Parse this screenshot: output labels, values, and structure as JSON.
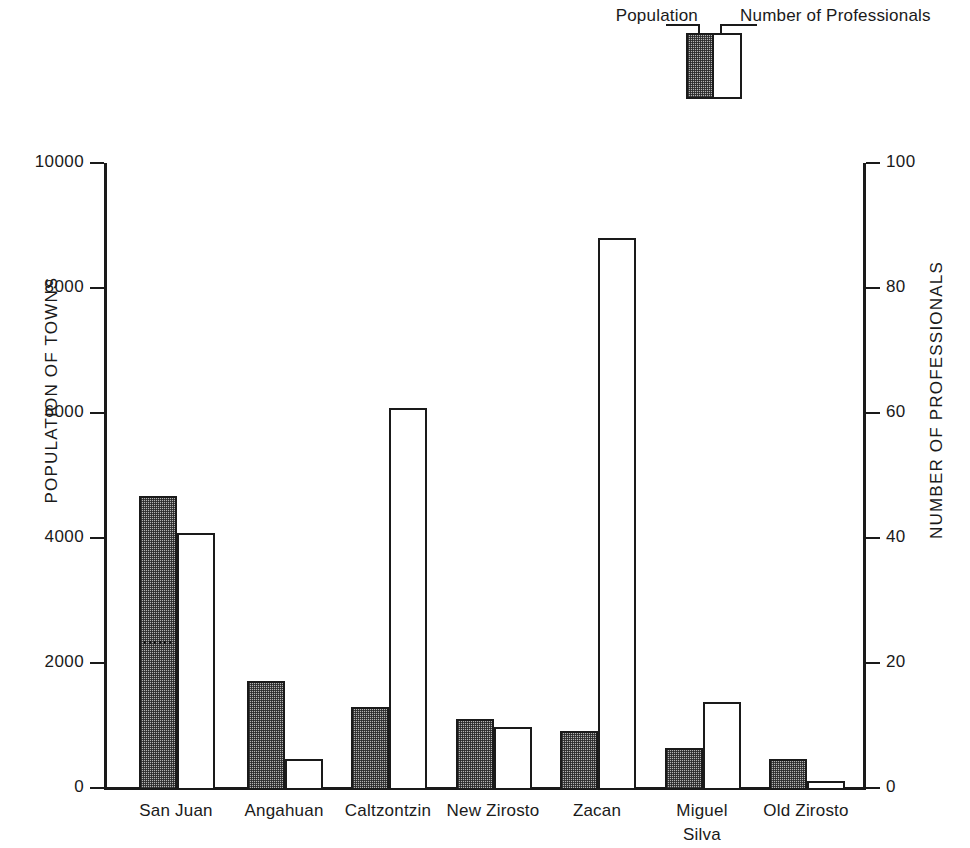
{
  "legend": {
    "left_label": "Population",
    "right_label": "Number of Professionals"
  },
  "axes": {
    "left_title": "POPULATION  OF  TOWNS",
    "right_title": "NUMBER  OF  PROFESSIONALS",
    "left_ticks": [
      "10000",
      "8000",
      "6000",
      "4000",
      "2000",
      "0"
    ],
    "right_ticks": [
      "100",
      "80",
      "60",
      "40",
      "20",
      "0"
    ]
  },
  "chart_data": {
    "type": "bar",
    "title": "",
    "xlabel": "",
    "ylabel": "POPULATION  OF  TOWNS",
    "y2label": "NUMBER  OF  PROFESSIONALS",
    "ylim": [
      0,
      10000
    ],
    "y2lim": [
      0,
      100
    ],
    "grid": false,
    "legend_position": "top-right",
    "categories": [
      "San Juan",
      "Angahuan",
      "Caltzontzin",
      "New Zirosto",
      "Zacan",
      "Miguel Silva",
      "Old Zirosto"
    ],
    "series": [
      {
        "name": "Population",
        "axis": "left",
        "values": [
          4690,
          1740,
          1320,
          1130,
          940,
          670,
          490
        ]
      },
      {
        "name": "Number of Professionals",
        "axis": "right",
        "values": [
          41,
          5,
          61,
          10,
          88,
          14,
          1.5
        ]
      }
    ],
    "annotations": [
      {
        "label": "dotted sub-division line in San Juan population bar",
        "category": "San Juan",
        "value": 2290
      }
    ]
  },
  "category_labels": [
    {
      "line1": "San Juan",
      "line2": ""
    },
    {
      "line1": "Angahuan",
      "line2": ""
    },
    {
      "line1": "Caltzontzin",
      "line2": ""
    },
    {
      "line1": "New Zirosto",
      "line2": ""
    },
    {
      "line1": "Zacan",
      "line2": ""
    },
    {
      "line1": "Miguel",
      "line2": "Silva"
    },
    {
      "line1": "Old Zirosto",
      "line2": ""
    }
  ],
  "colors": {
    "ink": "#1a1a1a",
    "shaded_fill": "#b4b4b4",
    "open_fill": "#ffffff",
    "background": "#ffffff"
  }
}
